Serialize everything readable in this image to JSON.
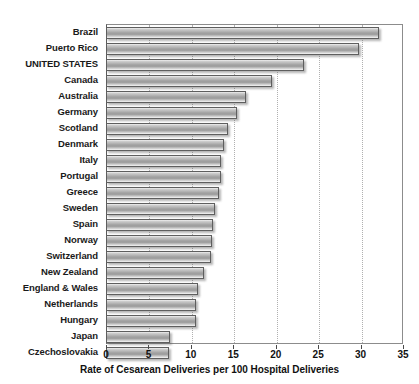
{
  "chart_data": {
    "type": "bar",
    "orientation": "horizontal",
    "title": "",
    "xlabel": "Rate of Cesarean Deliveries per 100 Hospital Deliveries",
    "ylabel": "",
    "xlim": [
      0,
      35
    ],
    "xticks": [
      0,
      5,
      10,
      15,
      20,
      25,
      30,
      35
    ],
    "grid": "vertical-dotted",
    "legend": "none",
    "categories": [
      "Brazil",
      "Puerto Rico",
      "UNITED STATES",
      "Canada",
      "Australia",
      "Germany",
      "Scotland",
      "Denmark",
      "Italy",
      "Portugal",
      "Greece",
      "Sweden",
      "Spain",
      "Norway",
      "Switzerland",
      "New Zealand",
      "England & Wales",
      "Netherlands",
      "Hungary",
      "Japan",
      "Czechoslovakia"
    ],
    "values": [
      32.2,
      29.8,
      23.3,
      19.6,
      16.5,
      15.4,
      14.4,
      13.9,
      13.5,
      13.5,
      13.3,
      12.8,
      12.6,
      12.5,
      12.4,
      11.5,
      10.9,
      10.6,
      10.6,
      7.6,
      7.4
    ]
  },
  "colors": {
    "bar_border": "#5e5e5e",
    "bar_fill_light": "#f2f2f2",
    "bar_fill_dark": "#9a9a9a",
    "gridline": "#b0b0b0",
    "axis": "#4a4a4a",
    "text": "#111111",
    "background": "#ffffff"
  }
}
